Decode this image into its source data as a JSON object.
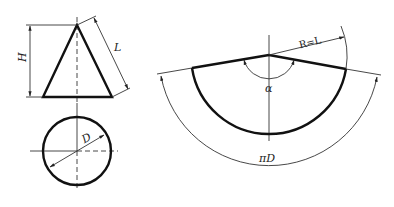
{
  "diagram": {
    "front_view": {
      "labels": {
        "height": "H",
        "slant": "L"
      }
    },
    "top_view": {
      "labels": {
        "diameter": "D"
      }
    },
    "development": {
      "labels": {
        "radius": "R=L",
        "angle": "α",
        "arc_length": "πD"
      }
    },
    "colors": {
      "line": "#111111",
      "thin_line": "#333333",
      "background": "#ffffff"
    }
  }
}
